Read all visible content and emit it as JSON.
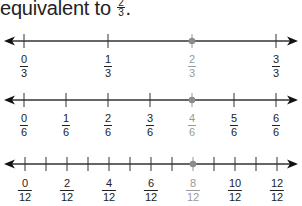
{
  "title": {
    "text": "equivalent to",
    "fraction": {
      "num": "2",
      "den": "3"
    },
    "punct": "."
  },
  "colors": {
    "line": "#333333",
    "highlight_point": "#8c8c8c",
    "highlight_label": "#9a9a9a"
  },
  "number_lines": [
    {
      "denominator": 3,
      "labels": [
        {
          "num": "0",
          "den": "3"
        },
        {
          "num": "1",
          "den": "3"
        },
        {
          "num": "2",
          "den": "3",
          "highlight": true
        },
        {
          "num": "3",
          "den": "3"
        }
      ],
      "tick_count": 4,
      "highlight_index": 2
    },
    {
      "denominator": 6,
      "labels": [
        {
          "num": "0",
          "den": "6"
        },
        {
          "num": "1",
          "den": "6"
        },
        {
          "num": "2",
          "den": "6"
        },
        {
          "num": "3",
          "den": "6"
        },
        {
          "num": "4",
          "den": "6",
          "highlight": true
        },
        {
          "num": "5",
          "den": "6"
        },
        {
          "num": "6",
          "den": "6"
        }
      ],
      "tick_count": 7,
      "highlight_index": 4
    },
    {
      "denominator": 12,
      "labels": [
        {
          "num": "0",
          "den": "12"
        },
        {
          "num": "2",
          "den": "12"
        },
        {
          "num": "4",
          "den": "12"
        },
        {
          "num": "6",
          "den": "12"
        },
        {
          "num": "8",
          "den": "12",
          "highlight": true
        },
        {
          "num": "10",
          "den": "12"
        },
        {
          "num": "12",
          "den": "12"
        }
      ],
      "tick_count": 13,
      "highlight_index": 8
    }
  ]
}
